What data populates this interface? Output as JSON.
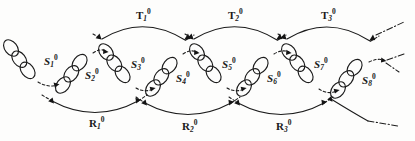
{
  "figure": {
    "type": "diagram",
    "background_color": "#fdfdfc",
    "ink_color": "#1b1b1b",
    "width": 415,
    "height": 141
  },
  "nodes": [
    {
      "id": "S1",
      "base": "S",
      "sub": "1",
      "sup": "0",
      "label": "S₁⁰",
      "orientation": "down-right",
      "ellipse_count": 3,
      "label_x": 44,
      "label_y": 62,
      "chain_start": {
        "x": 10,
        "y": 46
      },
      "chain_end": {
        "x": 34,
        "y": 80
      }
    },
    {
      "id": "S2",
      "base": "S",
      "sub": "2",
      "sup": "0",
      "label": "S₂⁰",
      "orientation": "up-right",
      "ellipse_count": 3,
      "label_x": 85,
      "label_y": 75,
      "chain_start": {
        "x": 63,
        "y": 86
      },
      "chain_end": {
        "x": 92,
        "y": 52
      }
    },
    {
      "id": "S3",
      "base": "S",
      "sub": "3",
      "sup": "0",
      "label": "S₃⁰",
      "orientation": "down-right",
      "ellipse_count": 3,
      "label_x": 131,
      "label_y": 65,
      "chain_start": {
        "x": 105,
        "y": 51
      },
      "chain_end": {
        "x": 133,
        "y": 86
      }
    },
    {
      "id": "S4",
      "base": "S",
      "sub": "4",
      "sup": "0",
      "label": "S₄⁰",
      "orientation": "up-right",
      "ellipse_count": 3,
      "label_x": 176,
      "label_y": 78,
      "chain_start": {
        "x": 152,
        "y": 88
      },
      "chain_end": {
        "x": 181,
        "y": 54
      }
    },
    {
      "id": "S5",
      "base": "S",
      "sub": "5",
      "sup": "0",
      "label": "S₅⁰",
      "orientation": "down-right",
      "ellipse_count": 3,
      "label_x": 222,
      "label_y": 65,
      "chain_start": {
        "x": 196,
        "y": 51
      },
      "chain_end": {
        "x": 224,
        "y": 86
      }
    },
    {
      "id": "S6",
      "base": "S",
      "sub": "6",
      "sup": "0",
      "label": "S₆⁰",
      "orientation": "up-right",
      "ellipse_count": 3,
      "label_x": 267,
      "label_y": 78,
      "chain_start": {
        "x": 243,
        "y": 88
      },
      "chain_end": {
        "x": 272,
        "y": 54
      }
    },
    {
      "id": "S7",
      "base": "S",
      "sub": "7",
      "sup": "0",
      "label": "S₇⁰",
      "orientation": "down-right",
      "ellipse_count": 3,
      "label_x": 314,
      "label_y": 65,
      "chain_start": {
        "x": 288,
        "y": 51
      },
      "chain_end": {
        "x": 316,
        "y": 86
      }
    },
    {
      "id": "S8",
      "base": "S",
      "sub": "8",
      "sup": "0",
      "label": "S₈⁰",
      "orientation": "up-right",
      "ellipse_count": 3,
      "label_x": 362,
      "label_y": 80,
      "chain_start": {
        "x": 337,
        "y": 90
      },
      "chain_end": {
        "x": 366,
        "y": 56
      }
    }
  ],
  "top_arcs": [
    {
      "id": "T1",
      "base": "T",
      "sub": "1",
      "sup": "0",
      "label": "T₁⁰",
      "label_x": 141,
      "label_y": 16,
      "from_node": "S2",
      "to_node": "S4"
    },
    {
      "id": "T2",
      "base": "T",
      "sub": "2",
      "sup": "0",
      "label": "T₂⁰",
      "label_x": 233,
      "label_y": 16,
      "from_node": "S4",
      "to_node": "S6"
    },
    {
      "id": "T3",
      "base": "T",
      "sub": "3",
      "sup": "0",
      "label": "T₃⁰",
      "label_x": 326,
      "label_y": 16,
      "from_node": "S6",
      "to_node": "S8"
    }
  ],
  "bottom_arcs": [
    {
      "id": "R1",
      "base": "R",
      "sub": "1",
      "sup": "0",
      "label": "R₁⁰",
      "label_x": 95,
      "label_y": 124,
      "from_node": "S1",
      "to_node": "S3"
    },
    {
      "id": "R2",
      "base": "R",
      "sub": "2",
      "sup": "0",
      "label": "R₂⁰",
      "label_x": 188,
      "label_y": 126,
      "from_node": "S3",
      "to_node": "S5"
    },
    {
      "id": "R3",
      "base": "R",
      "sub": "3",
      "sup": "0",
      "label": "R₃⁰",
      "label_x": 282,
      "label_y": 126,
      "from_node": "S5",
      "to_node": "S7"
    }
  ],
  "continuations": [
    {
      "id": "top-right",
      "position": "top-right",
      "style": "dash-dot"
    },
    {
      "id": "middle-right",
      "position": "middle-right",
      "style": "dash-dot"
    },
    {
      "id": "bottom-right",
      "position": "bottom-right",
      "style": "dash-dot"
    }
  ]
}
